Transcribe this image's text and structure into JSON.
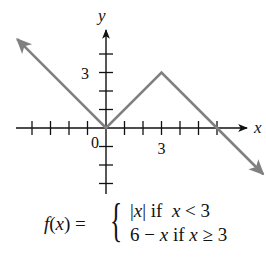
{
  "chart_data": {
    "type": "line",
    "title": "",
    "xlabel": "x",
    "ylabel": "y",
    "origin_label": "0",
    "x_tick_labels": [
      {
        "value": 3,
        "label": "3"
      }
    ],
    "y_tick_labels": [
      {
        "value": 3,
        "label": "3"
      }
    ],
    "x_ticks": [
      -4,
      -3,
      -2,
      -1,
      1,
      2,
      3,
      4,
      5,
      6
    ],
    "y_ticks": [
      -3,
      -2,
      -1,
      1,
      2,
      3,
      4
    ],
    "xlim": [
      -5,
      8.5
    ],
    "ylim": [
      -3.5,
      5.2
    ],
    "grid": false,
    "legend": null,
    "series": [
      {
        "name": "f(x)",
        "color": "#808080",
        "points": [
          [
            -4.8,
            4.8
          ],
          [
            0,
            0
          ],
          [
            3,
            3
          ],
          [
            6,
            0
          ],
          [
            8.5,
            -2.5
          ]
        ],
        "arrows": [
          "start",
          "end"
        ]
      }
    ],
    "annotations": [
      {
        "text": "f(x) = { |x| if x < 3 ; 6 − x if x ≥ 3 }"
      }
    ]
  },
  "formula": {
    "lhs": "f(x) =",
    "brace": "{",
    "case1": "|x| if  x < 3",
    "case2": "6 − x if x ≥ 3"
  },
  "colors": {
    "axes": "#111111",
    "curve": "#808080"
  }
}
